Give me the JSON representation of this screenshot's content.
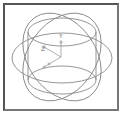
{
  "diagram": {
    "title": "",
    "axes": {
      "y_label": "Y",
      "z_label": "Z",
      "x_label": ""
    },
    "colors": {
      "rings": "#8a8a8a",
      "axis": "#999999",
      "frame": "#555555"
    }
  }
}
